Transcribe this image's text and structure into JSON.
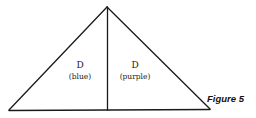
{
  "diagram": {
    "caption": "Figure 5",
    "regions": [
      {
        "letter": "D",
        "color_name": "(blue)"
      },
      {
        "letter": "D",
        "color_name": "(purple)"
      }
    ],
    "stroke_color": "#1a1a1a"
  }
}
